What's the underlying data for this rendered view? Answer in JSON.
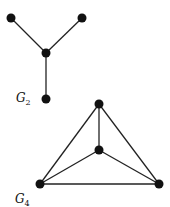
{
  "graphs": [
    {
      "label": "G",
      "subscript": "2",
      "nodes": [
        {
          "id": "a",
          "x": 11,
          "y": 18
        },
        {
          "id": "b",
          "x": 82,
          "y": 18
        },
        {
          "id": "c",
          "x": 46,
          "y": 53
        },
        {
          "id": "d",
          "x": 46,
          "y": 99
        }
      ],
      "edges": [
        [
          "a",
          "c"
        ],
        [
          "b",
          "c"
        ],
        [
          "c",
          "d"
        ]
      ]
    },
    {
      "label": "G",
      "subscript": "4",
      "nodes": [
        {
          "id": "t",
          "x": 99,
          "y": 104
        },
        {
          "id": "m",
          "x": 99,
          "y": 150
        },
        {
          "id": "l",
          "x": 40,
          "y": 184
        },
        {
          "id": "r",
          "x": 159,
          "y": 184
        }
      ],
      "edges": [
        [
          "t",
          "m"
        ],
        [
          "t",
          "l"
        ],
        [
          "t",
          "r"
        ],
        [
          "m",
          "l"
        ],
        [
          "m",
          "r"
        ],
        [
          "l",
          "r"
        ]
      ]
    }
  ],
  "colors": {
    "node": "#111111",
    "edge": "#222222"
  }
}
